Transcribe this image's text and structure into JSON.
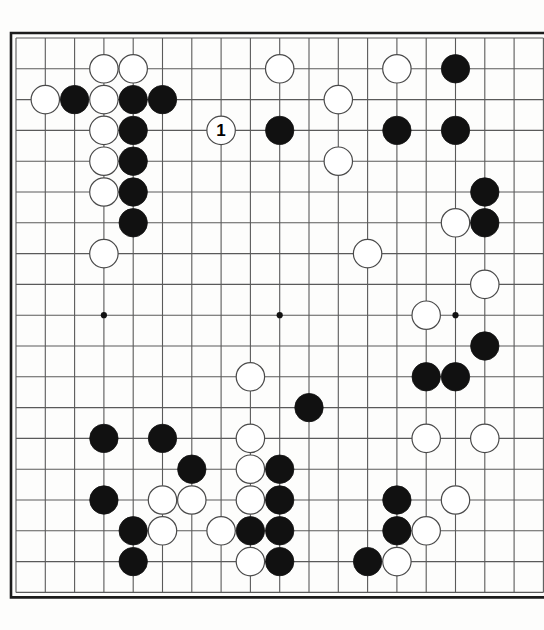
{
  "diagram": {
    "kind": "go-board-diagram",
    "board_size": 19,
    "visible_columns": 18,
    "visible_rows": 19,
    "colors": {
      "board_background": "#fdfdfc",
      "grid_line": "#5a5a5a",
      "border_line": "#1c1c1c",
      "black_stone": "#111111",
      "white_stone_fill": "#ffffff",
      "white_stone_edge": "#4a4a4a",
      "star_point": "#111111",
      "move_label_text": "#000000"
    },
    "geometry": {
      "origin_x": 16,
      "origin_y": 38,
      "col_spacing": 29.3,
      "row_spacing": 30.8,
      "stone_radius": 14.2,
      "border_offset": 5
    },
    "star_points": [
      [
        3,
        3
      ],
      [
        9,
        3
      ],
      [
        15,
        3
      ],
      [
        3,
        9
      ],
      [
        9,
        9
      ],
      [
        15,
        9
      ],
      [
        3,
        15
      ],
      [
        9,
        15
      ],
      [
        15,
        15
      ]
    ],
    "move_labels": [
      {
        "label": "1",
        "col": 7,
        "row": 3,
        "color": "white"
      }
    ],
    "stones": [
      {
        "col": 3,
        "row": 1,
        "color": "white"
      },
      {
        "col": 4,
        "row": 1,
        "color": "white"
      },
      {
        "col": 9,
        "row": 1,
        "color": "white"
      },
      {
        "col": 13,
        "row": 1,
        "color": "white"
      },
      {
        "col": 15,
        "row": 1,
        "color": "black"
      },
      {
        "col": 1,
        "row": 2,
        "color": "white"
      },
      {
        "col": 2,
        "row": 2,
        "color": "black"
      },
      {
        "col": 3,
        "row": 2,
        "color": "white"
      },
      {
        "col": 4,
        "row": 2,
        "color": "black"
      },
      {
        "col": 5,
        "row": 2,
        "color": "black"
      },
      {
        "col": 11,
        "row": 2,
        "color": "white"
      },
      {
        "col": 3,
        "row": 3,
        "color": "white"
      },
      {
        "col": 4,
        "row": 3,
        "color": "black"
      },
      {
        "col": 9,
        "row": 3,
        "color": "black"
      },
      {
        "col": 13,
        "row": 3,
        "color": "black"
      },
      {
        "col": 15,
        "row": 3,
        "color": "black"
      },
      {
        "col": 3,
        "row": 4,
        "color": "white"
      },
      {
        "col": 4,
        "row": 4,
        "color": "black"
      },
      {
        "col": 11,
        "row": 4,
        "color": "white"
      },
      {
        "col": 3,
        "row": 5,
        "color": "white"
      },
      {
        "col": 4,
        "row": 5,
        "color": "black"
      },
      {
        "col": 16,
        "row": 5,
        "color": "black"
      },
      {
        "col": 4,
        "row": 6,
        "color": "black"
      },
      {
        "col": 15,
        "row": 6,
        "color": "white"
      },
      {
        "col": 16,
        "row": 6,
        "color": "black"
      },
      {
        "col": 3,
        "row": 7,
        "color": "white"
      },
      {
        "col": 12,
        "row": 7,
        "color": "white"
      },
      {
        "col": 16,
        "row": 8,
        "color": "white"
      },
      {
        "col": 14,
        "row": 9,
        "color": "white"
      },
      {
        "col": 16,
        "row": 10,
        "color": "black"
      },
      {
        "col": 8,
        "row": 11,
        "color": "white"
      },
      {
        "col": 14,
        "row": 11,
        "color": "black"
      },
      {
        "col": 15,
        "row": 11,
        "color": "black"
      },
      {
        "col": 10,
        "row": 12,
        "color": "black"
      },
      {
        "col": 3,
        "row": 13,
        "color": "black"
      },
      {
        "col": 5,
        "row": 13,
        "color": "black"
      },
      {
        "col": 8,
        "row": 13,
        "color": "white"
      },
      {
        "col": 14,
        "row": 13,
        "color": "white"
      },
      {
        "col": 16,
        "row": 13,
        "color": "white"
      },
      {
        "col": 6,
        "row": 14,
        "color": "black"
      },
      {
        "col": 8,
        "row": 14,
        "color": "white"
      },
      {
        "col": 9,
        "row": 14,
        "color": "black"
      },
      {
        "col": 3,
        "row": 15,
        "color": "black"
      },
      {
        "col": 5,
        "row": 15,
        "color": "white"
      },
      {
        "col": 6,
        "row": 15,
        "color": "white"
      },
      {
        "col": 8,
        "row": 15,
        "color": "white"
      },
      {
        "col": 9,
        "row": 15,
        "color": "black"
      },
      {
        "col": 13,
        "row": 15,
        "color": "black"
      },
      {
        "col": 15,
        "row": 15,
        "color": "white"
      },
      {
        "col": 4,
        "row": 16,
        "color": "black"
      },
      {
        "col": 5,
        "row": 16,
        "color": "white"
      },
      {
        "col": 7,
        "row": 16,
        "color": "white"
      },
      {
        "col": 8,
        "row": 16,
        "color": "black"
      },
      {
        "col": 9,
        "row": 16,
        "color": "black"
      },
      {
        "col": 13,
        "row": 16,
        "color": "black"
      },
      {
        "col": 14,
        "row": 16,
        "color": "white"
      },
      {
        "col": 4,
        "row": 17,
        "color": "black"
      },
      {
        "col": 8,
        "row": 17,
        "color": "white"
      },
      {
        "col": 9,
        "row": 17,
        "color": "black"
      },
      {
        "col": 12,
        "row": 17,
        "color": "black"
      },
      {
        "col": 13,
        "row": 17,
        "color": "white"
      }
    ]
  }
}
